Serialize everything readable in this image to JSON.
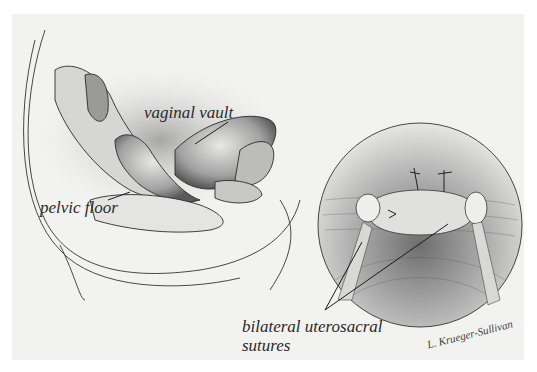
{
  "illustration": {
    "subject": "pelvic anatomy with uterosacral vault suspension",
    "labels": {
      "vaginal_vault": "vaginal vault",
      "pelvic_floor": "pelvic floor",
      "sutures_line1": "bilateral uterosacral",
      "sutures_line2": "sutures"
    },
    "signature": "L. Krueger-Sullivan",
    "colors": {
      "background": "#ffffff",
      "plate": "#f2f2f0",
      "ink": "#2a2a2a",
      "shade": "#8a8a8a"
    }
  }
}
